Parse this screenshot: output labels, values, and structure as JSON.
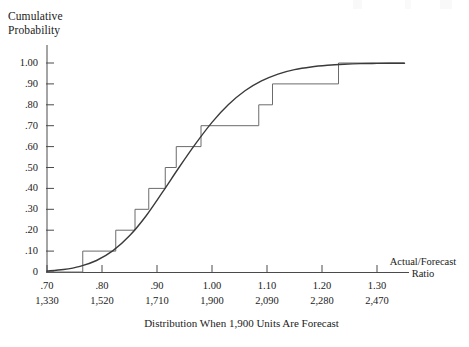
{
  "figure": {
    "y_axis_title": "Cumulative\nProbability",
    "x_axis_title": "Actual/Forecast\nRatio",
    "caption": "Distribution When 1,900 Units Are Forecast"
  },
  "chart_data": {
    "type": "line",
    "title": "",
    "subtitle": "",
    "caption": "Distribution When 1,900 Units Are Forecast",
    "xlabel": "Actual/Forecast Ratio",
    "ylabel": "Cumulative Probability",
    "xlim": [
      0.7,
      1.35
    ],
    "ylim": [
      0.0,
      1.02
    ],
    "grid": false,
    "legend": "none",
    "x_tick_labels": [
      ".70",
      ".80",
      ".90",
      "1.00",
      "1.10",
      "1.20",
      "1.30"
    ],
    "x_tick_values": [
      0.7,
      0.8,
      0.9,
      1.0,
      1.1,
      1.2,
      1.3
    ],
    "x_secondary_tick_labels": [
      "1,330",
      "1,520",
      "1,710",
      "1,900",
      "2,090",
      "2,280",
      "2,470"
    ],
    "x_secondary_tick_values": [
      1330,
      1520,
      1710,
      1900,
      2090,
      2280,
      2470
    ],
    "y_tick_labels": [
      "0",
      ".10",
      ".20",
      ".30",
      ".40",
      ".50",
      ".60",
      ".70",
      ".80",
      ".90",
      "1.00"
    ],
    "y_tick_values": [
      0.0,
      0.1,
      0.2,
      0.3,
      0.4,
      0.5,
      0.6,
      0.7,
      0.8,
      0.9,
      1.0
    ],
    "series": [
      {
        "name": "Empirical step distribution",
        "type": "step",
        "step_mode": "post",
        "color": "#6b6b6b",
        "x": [
          0.7,
          0.765,
          0.825,
          0.86,
          0.885,
          0.915,
          0.935,
          0.98,
          1.085,
          1.11,
          1.23,
          1.35
        ],
        "y": [
          0.0,
          0.1,
          0.2,
          0.3,
          0.4,
          0.5,
          0.6,
          0.7,
          0.8,
          0.9,
          1.0,
          1.0
        ]
      },
      {
        "name": "Smooth cumulative (normal ogive)",
        "type": "line",
        "color": "#3a3a3a",
        "x": [
          0.7,
          0.73,
          0.76,
          0.79,
          0.82,
          0.85,
          0.88,
          0.91,
          0.94,
          0.97,
          1.0,
          1.03,
          1.06,
          1.09,
          1.12,
          1.15,
          1.18,
          1.21,
          1.24,
          1.27,
          1.3,
          1.35
        ],
        "y": [
          0.005,
          0.012,
          0.027,
          0.055,
          0.102,
          0.173,
          0.268,
          0.382,
          0.5,
          0.613,
          0.716,
          0.801,
          0.867,
          0.914,
          0.947,
          0.968,
          0.981,
          0.989,
          0.994,
          0.997,
          0.998,
          0.999
        ]
      }
    ],
    "distribution": {
      "mean_ratio": 0.94,
      "mean_units": 1900,
      "forecast_units": 1900
    }
  }
}
